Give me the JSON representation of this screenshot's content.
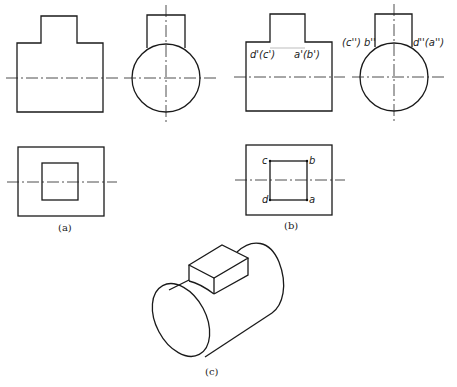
{
  "figure": {
    "captions": {
      "a": "(a)",
      "b": "(b)",
      "c": "(c)"
    },
    "view_b": {
      "front_labels": {
        "left": "d'(c')",
        "right": "a'(b')"
      },
      "side_labels": {
        "left": "(c'') b''",
        "right": "d''(a'')"
      },
      "top_labels": {
        "top_left": "c",
        "top_right": "b",
        "bottom_left": "d",
        "bottom_right": "a"
      }
    },
    "colors": {
      "line": "#1a1a1a",
      "background": "#ffffff"
    }
  }
}
